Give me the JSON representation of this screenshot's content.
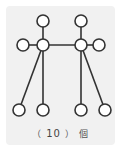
{
  "diagram": {
    "type": "graph",
    "background_color": "#f1f1f1",
    "stroke_color": "#333333",
    "node_fill": "#ffffff",
    "node_radius": 6,
    "nodes": [
      {
        "id": "n1",
        "x": 43,
        "y": 21
      },
      {
        "id": "n2",
        "x": 81,
        "y": 21
      },
      {
        "id": "n3",
        "x": 23,
        "y": 45
      },
      {
        "id": "n4",
        "x": 43,
        "y": 45
      },
      {
        "id": "n5",
        "x": 81,
        "y": 45
      },
      {
        "id": "n6",
        "x": 99,
        "y": 45
      },
      {
        "id": "n7",
        "x": 19,
        "y": 110
      },
      {
        "id": "n8",
        "x": 43,
        "y": 110
      },
      {
        "id": "n9",
        "x": 81,
        "y": 110
      },
      {
        "id": "n10",
        "x": 105,
        "y": 110
      }
    ],
    "edges": [
      [
        "n1",
        "n4"
      ],
      [
        "n3",
        "n4"
      ],
      [
        "n4",
        "n5"
      ],
      [
        "n2",
        "n5"
      ],
      [
        "n5",
        "n6"
      ],
      [
        "n4",
        "n7"
      ],
      [
        "n4",
        "n8"
      ],
      [
        "n5",
        "n9"
      ],
      [
        "n5",
        "n10"
      ]
    ]
  },
  "caption": {
    "open_paren": "（",
    "answer": "10",
    "close_paren": "）",
    "unit": "個"
  }
}
